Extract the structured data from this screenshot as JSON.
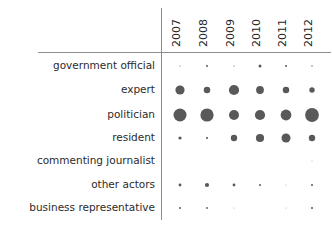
{
  "chart_data": {
    "type": "bar",
    "subtype": "bubble-matrix",
    "title": "",
    "subtitle": "",
    "xlabel": "",
    "ylabel": "",
    "grid": false,
    "legend": "none",
    "axis_color": "#8c8c8c",
    "bubble_color": "#595959",
    "categories": [
      "2007",
      "2008",
      "2009",
      "2010",
      "2011",
      "2012"
    ],
    "rows": [
      "government official",
      "expert",
      "politician",
      "resident",
      "commenting journalist",
      "other actors",
      "business representative"
    ],
    "series": [
      {
        "name": "government official",
        "values": [
          1.1,
          2.0,
          1.1,
          3.0,
          2.0,
          1.3
        ]
      },
      {
        "name": "expert",
        "values": [
          9.2,
          6.5,
          10.2,
          7.8,
          6.5,
          5.4
        ]
      },
      {
        "name": "politician",
        "values": [
          13.0,
          13.2,
          10.0,
          10.2,
          10.8,
          13.8
        ]
      },
      {
        "name": "resident",
        "values": [
          3.2,
          2.1,
          6.4,
          8.2,
          9.0,
          6.4
        ]
      },
      {
        "name": "commenting journalist",
        "values": [
          0,
          0,
          0,
          0,
          0,
          0.8
        ]
      },
      {
        "name": "other actors",
        "values": [
          2.9,
          4.2,
          2.8,
          2.0,
          0.8,
          2.0
        ]
      },
      {
        "name": "business representative",
        "values": [
          2.0,
          1.8,
          0.8,
          0,
          0.8,
          2.0
        ]
      }
    ],
    "ylim": [
      0,
      0
    ],
    "xlim": [
      0,
      0
    ]
  },
  "layout": {
    "col_x": [
      180,
      207,
      234,
      260,
      286,
      312
    ],
    "row_y": [
      66,
      90,
      115,
      138,
      161,
      185,
      208
    ],
    "label_right_x": 155,
    "v_axis_x": 161,
    "v_axis_y1": 8,
    "v_axis_y2": 220,
    "h_axis_y": 52,
    "h_axis_x1": 38,
    "h_axis_x2": 331
  }
}
